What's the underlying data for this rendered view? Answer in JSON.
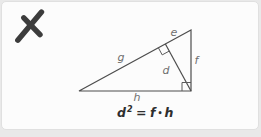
{
  "card": {
    "grading_mark": "incorrect-cross"
  },
  "diagram": {
    "labels": {
      "e": "e",
      "g": "g",
      "f": "f",
      "d": "d",
      "h": "h"
    }
  },
  "formula": {
    "lhs_base": "d",
    "lhs_exponent": "2",
    "equals": "=",
    "rhs_first": "f",
    "operator": "•",
    "rhs_second": "h"
  },
  "colors": {
    "page_background": "#e9e9e9",
    "card_background": "#fcfcfc",
    "card_border": "#e0e0e0",
    "cross_mark": "#3c3c3c",
    "triangle_lines": "#4d4d4d",
    "side_labels": "#6f6f6f",
    "formula_text": "#2e2e2e"
  }
}
